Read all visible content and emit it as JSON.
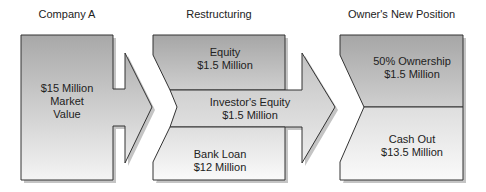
{
  "columns": [
    {
      "title": "Company A"
    },
    {
      "title": "Restructuring"
    },
    {
      "title": "Owner's New Position"
    }
  ],
  "company_a": {
    "line1": "$15 Million",
    "line2": "Market",
    "line3": "Value"
  },
  "restructuring": {
    "equity": {
      "label": "Equity",
      "value": "$1.5 Million"
    },
    "investor_equity": {
      "label": "Investor's Equity",
      "value": "$1.5 Million"
    },
    "bank_loan": {
      "label": "Bank Loan",
      "value": "$12 Million"
    }
  },
  "owner_position": {
    "ownership": {
      "label": "50% Ownership",
      "value": "$1.5 Million"
    },
    "cash_out": {
      "label": "Cash Out",
      "value": "$13.5 Million"
    }
  },
  "colors": {
    "dark_fill": "#a9a9a9",
    "light_fill": "#f2f2f2",
    "stroke": "#333333",
    "shadow": "#bdbdbd"
  }
}
